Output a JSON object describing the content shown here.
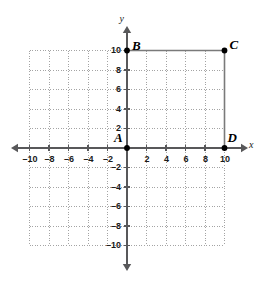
{
  "figure": {
    "kind": "coordinate-plane",
    "background_color": "#ffffff",
    "axis_color": "#58585a",
    "grid_color": "#9a9a9a",
    "shape_color": "#7a7a7a",
    "point_color": "#000000",
    "label_color": "#1a1a1a"
  },
  "axes": {
    "x_label": "x",
    "y_label": "y",
    "x_min": -10,
    "x_max": 10,
    "y_min": -10,
    "y_max": 10,
    "tick_step": 2,
    "grid": true,
    "grid_style": "dotted",
    "x_ticks": [
      {
        "value": -10,
        "label": "–10"
      },
      {
        "value": -8,
        "label": "–8"
      },
      {
        "value": -6,
        "label": "–6"
      },
      {
        "value": -4,
        "label": "–4"
      },
      {
        "value": -2,
        "label": "–2"
      },
      {
        "value": 2,
        "label": "2"
      },
      {
        "value": 4,
        "label": "4"
      },
      {
        "value": 6,
        "label": "6"
      },
      {
        "value": 8,
        "label": "8"
      },
      {
        "value": 10,
        "label": "10"
      }
    ],
    "y_ticks": [
      {
        "value": 10,
        "label": "10"
      },
      {
        "value": 8,
        "label": "8"
      },
      {
        "value": 6,
        "label": "6"
      },
      {
        "value": 4,
        "label": "4"
      },
      {
        "value": 2,
        "label": "2"
      },
      {
        "value": -2,
        "label": "–2"
      },
      {
        "value": -4,
        "label": "–4"
      },
      {
        "value": -6,
        "label": "–6"
      },
      {
        "value": -8,
        "label": "–8"
      },
      {
        "value": -10,
        "label": "–10"
      }
    ]
  },
  "points": [
    {
      "name": "A",
      "label": "A",
      "x": 0,
      "y": 0,
      "label_dx": -13,
      "label_dy": -17
    },
    {
      "name": "B",
      "label": "B",
      "x": 0,
      "y": 10,
      "label_dx": 5,
      "label_dy": -12
    },
    {
      "name": "C",
      "label": "C",
      "x": 10,
      "y": 10,
      "label_dx": 5,
      "label_dy": -13
    },
    {
      "name": "D",
      "label": "D",
      "x": 10,
      "y": 0,
      "label_dx": 3,
      "label_dy": -17
    }
  ],
  "segments": [
    {
      "name": "segment-b-c",
      "from": "B",
      "to": "C"
    },
    {
      "name": "segment-c-d",
      "from": "C",
      "to": "D"
    }
  ],
  "chart_data": {
    "type": "scatter",
    "title": "",
    "xlabel": "x",
    "ylabel": "y",
    "xlim": [
      -10,
      10
    ],
    "ylim": [
      -10,
      10
    ],
    "grid": true,
    "legend": "none",
    "points": [
      {
        "label": "A",
        "x": 0,
        "y": 0
      },
      {
        "label": "B",
        "x": 0,
        "y": 10
      },
      {
        "label": "C",
        "x": 10,
        "y": 10
      },
      {
        "label": "D",
        "x": 10,
        "y": 0
      }
    ],
    "connections": [
      [
        "B",
        "C"
      ],
      [
        "C",
        "D"
      ]
    ],
    "x_tick_values": [
      -10,
      -8,
      -6,
      -4,
      -2,
      2,
      4,
      6,
      8,
      10
    ],
    "y_tick_values": [
      -10,
      -8,
      -6,
      -4,
      -2,
      2,
      4,
      6,
      8,
      10
    ]
  }
}
